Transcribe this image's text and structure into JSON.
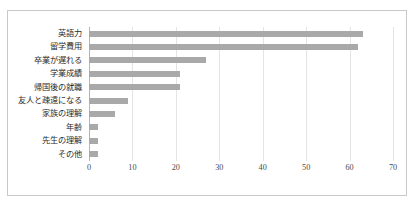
{
  "chart_data": {
    "type": "bar",
    "orientation": "horizontal",
    "title": "",
    "xlabel": "",
    "ylabel": "",
    "xlim": [
      0,
      70
    ],
    "xticks": [
      "0",
      "10",
      "20",
      "30",
      "40",
      "50",
      "60",
      "70"
    ],
    "grid": true,
    "legend": "none",
    "bar_color": "#a9a9a9",
    "border_color": "#c9c9c9",
    "gridline_color": "#e4e4e4",
    "categories": [
      "英語力",
      "留学費用",
      "卒業が遅れる",
      "学業成績",
      "帰国後の就職",
      "友人と疎遠になる",
      "家族の理解",
      "年齢",
      "先生の理解",
      "その他"
    ],
    "values": [
      63,
      62,
      27,
      21,
      21,
      9,
      6,
      2,
      2,
      2
    ]
  }
}
